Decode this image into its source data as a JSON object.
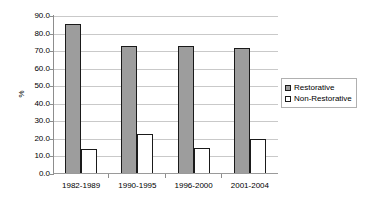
{
  "chart_data": {
    "type": "bar",
    "title": "",
    "subtitle": "",
    "xlabel": "",
    "ylabel": "%",
    "ylim": [
      0.0,
      90.0
    ],
    "ytick_step": 10.0,
    "ytick_labels": [
      "90.0",
      "80.0",
      "70.0",
      "60.0",
      "50.0",
      "40.0",
      "30.0",
      "20.0",
      "10.0",
      "0.0"
    ],
    "ytick_values": [
      90.0,
      80.0,
      70.0,
      60.0,
      50.0,
      40.0,
      30.0,
      20.0,
      10.0,
      0.0
    ],
    "grid": true,
    "grid_axis": "y",
    "legend_position": "right",
    "categories": [
      "1982-1989",
      "1990-1995",
      "1996-2000",
      "2001-2004"
    ],
    "series": [
      {
        "name": "Restorative",
        "color": "#9d9d9d",
        "values": [
          85.5,
          73.0,
          72.8,
          71.5
        ]
      },
      {
        "name": "Non-Restorative",
        "color": "#ffffff",
        "values": [
          14.0,
          23.0,
          15.0,
          20.0
        ]
      }
    ]
  },
  "legend": {
    "entries": [
      {
        "label": "Restorative",
        "swatch": "gray-filled-square"
      },
      {
        "label": "Non-Restorative",
        "swatch": "white-filled-square"
      }
    ]
  },
  "colors": {
    "restorative_fill": "#9d9d9d",
    "nonrestorative_fill": "#ffffff",
    "bar_border": "#1a1a1a",
    "gridline": "#c9c9c9",
    "axis": "#8d8d8d",
    "text": "#000000",
    "background": "#ffffff"
  }
}
